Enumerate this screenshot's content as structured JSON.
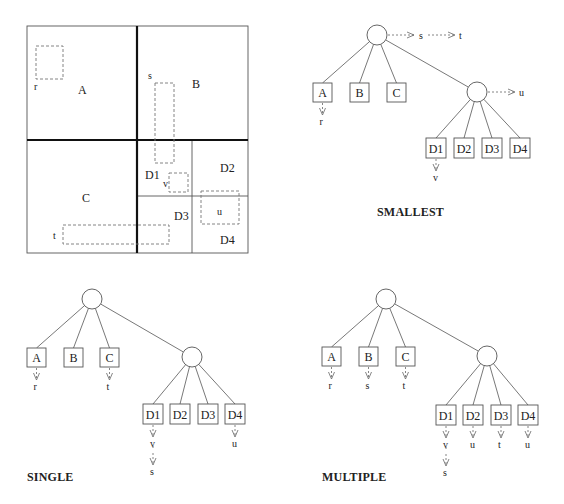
{
  "grid": {
    "outer": {
      "x": 27,
      "y": 26,
      "w": 221,
      "h": 227
    },
    "thick_lines": [
      {
        "x1": 137,
        "y1": 26,
        "x2": 137,
        "y2": 253
      },
      {
        "x1": 27,
        "y1": 140,
        "x2": 248,
        "y2": 140
      }
    ],
    "thin_lines": [
      {
        "x1": 192,
        "y1": 140,
        "x2": 192,
        "y2": 253
      },
      {
        "x1": 137,
        "y1": 196,
        "x2": 248,
        "y2": 196
      }
    ],
    "regions": [
      {
        "label": "A",
        "x": 78,
        "y": 94
      },
      {
        "label": "B",
        "x": 192,
        "y": 88
      },
      {
        "label": "C",
        "x": 82,
        "y": 202
      },
      {
        "label": "D1",
        "x": 145,
        "y": 179
      },
      {
        "label": "D2",
        "x": 220,
        "y": 172
      },
      {
        "label": "D3",
        "x": 174,
        "y": 220
      },
      {
        "label": "D4",
        "x": 220,
        "y": 244
      }
    ],
    "objects": [
      {
        "name": "r",
        "x": 36,
        "y": 46,
        "w": 27,
        "h": 33,
        "lx": 34,
        "ly": 90
      },
      {
        "name": "s",
        "x": 155,
        "y": 83,
        "w": 19,
        "h": 80,
        "lx": 148,
        "ly": 79
      },
      {
        "name": "v",
        "x": 169,
        "y": 173,
        "w": 19,
        "h": 19,
        "lx": 163,
        "ly": 187
      },
      {
        "name": "u",
        "x": 201,
        "y": 191,
        "w": 38,
        "h": 33,
        "lx": 217,
        "ly": 215
      },
      {
        "name": "t",
        "x": 63,
        "y": 225,
        "w": 106,
        "h": 19,
        "lx": 53,
        "ly": 239
      }
    ]
  },
  "trees": [
    {
      "name": "smallest",
      "title": "SMALLEST",
      "title_pos": {
        "x": 377,
        "y": 216
      },
      "root": {
        "cx": 377,
        "cy": 35,
        "r": 10
      },
      "root_chain": [
        {
          "x1": 388,
          "x2": 414,
          "y": 35,
          "label": "s",
          "lx": 419,
          "ly": 39
        },
        {
          "x1": 428,
          "x2": 455,
          "y": 35,
          "label": "t",
          "lx": 459,
          "ly": 39
        }
      ],
      "leaves": [
        {
          "label": "A",
          "x": 313,
          "y": 83,
          "w": 19,
          "h": 19,
          "objects": [
            "r"
          ]
        },
        {
          "label": "B",
          "x": 350,
          "y": 83,
          "w": 19,
          "h": 19,
          "objects": []
        },
        {
          "label": "C",
          "x": 387,
          "y": 83,
          "w": 19,
          "h": 19,
          "objects": []
        }
      ],
      "inner": {
        "cx": 477,
        "cy": 92,
        "r": 10
      },
      "inner_chain": [
        {
          "x1": 488,
          "x2": 515,
          "y": 92,
          "label": "u",
          "lx": 519,
          "ly": 96
        }
      ],
      "sub_leaves": [
        {
          "label": "D1",
          "x": 426,
          "y": 138,
          "w": 20,
          "h": 20,
          "objects": [
            "v"
          ]
        },
        {
          "label": "D2",
          "x": 454,
          "y": 138,
          "w": 20,
          "h": 20,
          "objects": []
        },
        {
          "label": "D3",
          "x": 482,
          "y": 138,
          "w": 20,
          "h": 20,
          "objects": []
        },
        {
          "label": "D4",
          "x": 510,
          "y": 138,
          "w": 20,
          "h": 20,
          "objects": []
        }
      ]
    },
    {
      "name": "single",
      "title": "SINGLE",
      "title_pos": {
        "x": 27,
        "y": 481
      },
      "root": {
        "cx": 92,
        "cy": 299,
        "r": 10
      },
      "root_chain": [],
      "leaves": [
        {
          "label": "A",
          "x": 27,
          "y": 348,
          "w": 19,
          "h": 19,
          "objects": [
            "r"
          ]
        },
        {
          "label": "B",
          "x": 64,
          "y": 348,
          "w": 19,
          "h": 19,
          "objects": []
        },
        {
          "label": "C",
          "x": 100,
          "y": 348,
          "w": 19,
          "h": 19,
          "objects": [
            "t"
          ]
        }
      ],
      "inner": {
        "cx": 192,
        "cy": 357,
        "r": 10
      },
      "inner_chain": [],
      "sub_leaves": [
        {
          "label": "D1",
          "x": 143,
          "y": 404,
          "w": 20,
          "h": 20,
          "objects": [
            "v",
            "s"
          ]
        },
        {
          "label": "D2",
          "x": 170,
          "y": 404,
          "w": 20,
          "h": 20,
          "objects": []
        },
        {
          "label": "D3",
          "x": 198,
          "y": 404,
          "w": 20,
          "h": 20,
          "objects": []
        },
        {
          "label": "D4",
          "x": 225,
          "y": 404,
          "w": 20,
          "h": 20,
          "objects": [
            "u"
          ]
        }
      ]
    },
    {
      "name": "multiple",
      "title": "MULTIPLE",
      "title_pos": {
        "x": 322,
        "y": 481
      },
      "root": {
        "cx": 386,
        "cy": 299,
        "r": 10
      },
      "root_chain": [],
      "leaves": [
        {
          "label": "A",
          "x": 322,
          "y": 347,
          "w": 19,
          "h": 19,
          "objects": [
            "r"
          ]
        },
        {
          "label": "B",
          "x": 359,
          "y": 347,
          "w": 19,
          "h": 19,
          "objects": [
            "s"
          ]
        },
        {
          "label": "C",
          "x": 396,
          "y": 347,
          "w": 19,
          "h": 19,
          "objects": [
            "t"
          ]
        }
      ],
      "inner": {
        "cx": 487,
        "cy": 356,
        "r": 10
      },
      "inner_chain": [],
      "sub_leaves": [
        {
          "label": "D1",
          "x": 436,
          "y": 405,
          "w": 20,
          "h": 20,
          "objects": [
            "v",
            "s"
          ]
        },
        {
          "label": "D2",
          "x": 463,
          "y": 405,
          "w": 20,
          "h": 20,
          "objects": [
            "u"
          ]
        },
        {
          "label": "D3",
          "x": 491,
          "y": 405,
          "w": 20,
          "h": 20,
          "objects": [
            "t"
          ]
        },
        {
          "label": "D4",
          "x": 518,
          "y": 405,
          "w": 20,
          "h": 20,
          "objects": [
            "u"
          ]
        }
      ]
    }
  ],
  "colors": {
    "line": "#555555",
    "thick": "#111111",
    "dash": "#777777",
    "text": "#222222"
  }
}
